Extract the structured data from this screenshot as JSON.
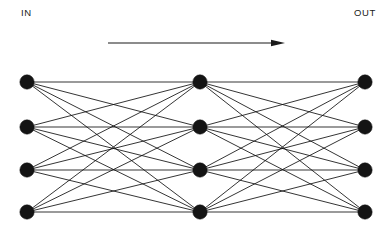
{
  "diagram": {
    "background_color": "#ffffff",
    "node_color": "#141414",
    "edge_color": "#111111",
    "labels": {
      "input": "IN",
      "output": "OUT"
    },
    "flow_arrow": {
      "name": "flow-direction-arrow",
      "direction": "left-to-right",
      "x_start": 108,
      "x_end": 285,
      "y": 43
    },
    "node_radius": 7.2,
    "layers": [
      {
        "name": "input-layer",
        "x": 27,
        "node_count": 4,
        "nodes_y": [
          82,
          127,
          170,
          212
        ]
      },
      {
        "name": "hidden-layer",
        "x": 200,
        "node_count": 4,
        "nodes_y": [
          82,
          127,
          170,
          212
        ]
      },
      {
        "name": "output-layer",
        "x": 365,
        "node_count": 4,
        "nodes_y": [
          82,
          127,
          170,
          212
        ]
      }
    ],
    "connections": [
      {
        "name": "input-to-hidden",
        "from_layer": 0,
        "to_layer": 1,
        "fully_connected": true,
        "edge_count": 16
      },
      {
        "name": "hidden-to-output",
        "from_layer": 1,
        "to_layer": 2,
        "fully_connected": true,
        "edge_count": 16
      }
    ]
  }
}
